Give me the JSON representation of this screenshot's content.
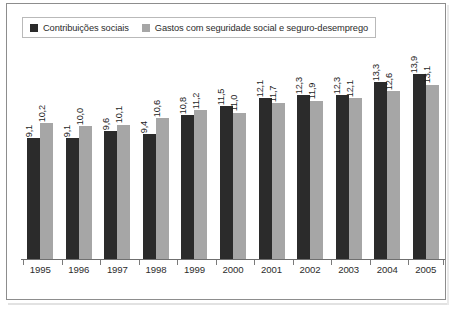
{
  "chart_data": {
    "type": "bar",
    "title": "",
    "subtitle": "",
    "xlabel": "",
    "ylabel": "",
    "grid": false,
    "legend_position": "top-left",
    "decimal_separator": ",",
    "ylim": [
      0,
      16
    ],
    "categories": [
      "1995",
      "1996",
      "1997",
      "1998",
      "1999",
      "2000",
      "2001",
      "2002",
      "2003",
      "2004",
      "2005"
    ],
    "series": [
      {
        "name": "Contribuições sociais",
        "color": "#2b2b2b",
        "values": [
          9.1,
          9.1,
          9.6,
          9.4,
          10.8,
          11.5,
          12.1,
          12.3,
          12.3,
          13.3,
          13.9
        ],
        "labels": [
          "9,1",
          "9,1",
          "9,6",
          "9,4",
          "10,8",
          "11,5",
          "12,1",
          "12,3",
          "12,3",
          "13,3",
          "13,9"
        ]
      },
      {
        "name": "Gastos com seguridade social e seguro-desemprego",
        "color": "#a6a6a6",
        "values": [
          10.2,
          10.0,
          10.1,
          10.6,
          11.2,
          11.0,
          11.7,
          11.9,
          12.1,
          12.6,
          13.1
        ],
        "labels": [
          "10,2",
          "10,0",
          "10,1",
          "10,6",
          "11,2",
          "11,0",
          "11,7",
          "11,9",
          "12,1",
          "12,6",
          "13,1"
        ]
      }
    ]
  },
  "legend": {
    "entries": [
      {
        "label": "Contribuições sociais",
        "swatch": "#2b2b2b",
        "icon": "legend-square-dark-icon"
      },
      {
        "label": "Gastos com seguridade social e seguro-desemprego",
        "swatch": "#a6a6a6",
        "icon": "legend-square-light-icon"
      }
    ]
  }
}
